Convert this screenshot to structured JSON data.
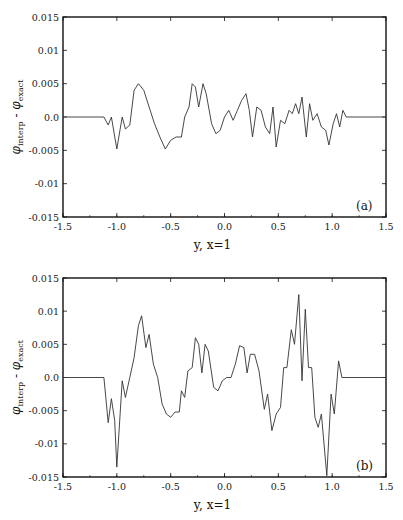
{
  "figure": {
    "panels": [
      {
        "tag": "(a)",
        "xlabel": "y, x=1",
        "ylabel_main": "φ",
        "ylabel_sub1": "interp",
        "ylabel_mid": " - ",
        "ylabel_sub2": "exact"
      },
      {
        "tag": "(b)",
        "xlabel": "y, x=1",
        "ylabel_main": "φ",
        "ylabel_sub1": "interp",
        "ylabel_mid": " - ",
        "ylabel_sub2": "exact"
      }
    ],
    "line_color": "#333333"
  },
  "chart_data": [
    {
      "type": "line",
      "title": "(a)",
      "xlabel": "y, x=1",
      "ylabel": "φ_interp - φ_exact",
      "xlim": [
        -1.5,
        1.5
      ],
      "ylim": [
        -0.015,
        0.015
      ],
      "xticks": [
        "-1.5",
        "-1.0",
        "-0.5",
        "0.0",
        "0.5",
        "1.0",
        "1.5"
      ],
      "yticks": [
        "0.015",
        "0.01",
        "0.005",
        "0.0",
        "-0.005",
        "-0.01",
        "-0.015"
      ],
      "grid": false,
      "legend": null,
      "x": [
        -1.5,
        -1.12,
        -1.08,
        -1.05,
        -1.0,
        -0.95,
        -0.92,
        -0.88,
        -0.84,
        -0.8,
        -0.75,
        -0.7,
        -0.65,
        -0.6,
        -0.55,
        -0.5,
        -0.45,
        -0.4,
        -0.37,
        -0.33,
        -0.3,
        -0.27,
        -0.24,
        -0.2,
        -0.17,
        -0.12,
        -0.08,
        -0.04,
        0.0,
        0.04,
        0.08,
        0.12,
        0.16,
        0.2,
        0.23,
        0.26,
        0.3,
        0.34,
        0.38,
        0.42,
        0.45,
        0.48,
        0.52,
        0.56,
        0.6,
        0.63,
        0.66,
        0.69,
        0.72,
        0.76,
        0.79,
        0.82,
        0.86,
        0.9,
        0.94,
        0.97,
        1.01,
        1.04,
        1.07,
        1.1,
        1.13,
        1.5
      ],
      "y": [
        0.0,
        0.0,
        -0.0012,
        0.0,
        -0.0048,
        0.0,
        -0.0018,
        -0.0012,
        0.004,
        0.005,
        0.004,
        0.0015,
        -0.001,
        -0.003,
        -0.0048,
        -0.0035,
        -0.003,
        -0.003,
        0.0,
        0.0015,
        0.005,
        0.0045,
        0.0015,
        0.005,
        0.0035,
        -0.001,
        -0.0025,
        -0.002,
        0.0,
        0.001,
        -0.0005,
        0.001,
        0.0025,
        0.0035,
        0.001,
        -0.003,
        0.0015,
        0.001,
        -0.0015,
        -0.0025,
        0.0015,
        -0.0045,
        -0.0005,
        -0.001,
        0.001,
        0.0005,
        0.002,
        0.0005,
        0.003,
        -0.003,
        0.002,
        -0.0005,
        0.0005,
        -0.0015,
        -0.002,
        -0.0042,
        -0.001,
        0.0005,
        -0.0015,
        0.001,
        0.0,
        0.0
      ]
    },
    {
      "type": "line",
      "title": "(b)",
      "xlabel": "y, x=1",
      "ylabel": "φ_interp - φ_exact",
      "xlim": [
        -1.5,
        1.5
      ],
      "ylim": [
        -0.015,
        0.015
      ],
      "xticks": [
        "-1.5",
        "-1.0",
        "-0.5",
        "0.0",
        "0.5",
        "1.0",
        "1.5"
      ],
      "yticks": [
        "0.015",
        "0.01",
        "0.005",
        "0.0",
        "-0.005",
        "-0.01",
        "-0.015"
      ],
      "grid": false,
      "legend": null,
      "x": [
        -1.5,
        -1.12,
        -1.08,
        -1.05,
        -1.02,
        -1.0,
        -0.95,
        -0.92,
        -0.88,
        -0.84,
        -0.8,
        -0.77,
        -0.73,
        -0.7,
        -0.66,
        -0.62,
        -0.58,
        -0.54,
        -0.5,
        -0.46,
        -0.42,
        -0.4,
        -0.37,
        -0.34,
        -0.3,
        -0.27,
        -0.24,
        -0.21,
        -0.18,
        -0.15,
        -0.1,
        -0.06,
        -0.02,
        0.02,
        0.06,
        0.1,
        0.14,
        0.18,
        0.21,
        0.24,
        0.28,
        0.32,
        0.37,
        0.4,
        0.44,
        0.48,
        0.52,
        0.55,
        0.58,
        0.62,
        0.65,
        0.69,
        0.72,
        0.75,
        0.78,
        0.81,
        0.84,
        0.87,
        0.9,
        0.95,
        0.99,
        1.02,
        1.06,
        1.09,
        1.5
      ],
      "y": [
        0.0,
        0.0,
        -0.0068,
        -0.0032,
        -0.0065,
        -0.0135,
        -0.0005,
        -0.003,
        0.0,
        0.003,
        0.0078,
        0.0093,
        0.0045,
        0.0065,
        0.002,
        0.0,
        -0.004,
        -0.0055,
        -0.006,
        -0.0052,
        -0.0052,
        -0.002,
        -0.003,
        0.001,
        0.0015,
        0.006,
        0.005,
        0.0007,
        0.005,
        0.004,
        -0.0015,
        -0.002,
        -0.0005,
        0.0,
        0.0,
        0.002,
        0.0048,
        0.0045,
        0.0007,
        0.0035,
        0.0035,
        0.001,
        -0.0048,
        -0.0025,
        -0.008,
        -0.0055,
        -0.0045,
        0.0015,
        0.0015,
        0.0072,
        0.005,
        0.0125,
        -0.0005,
        0.0103,
        0.0015,
        0.0015,
        -0.006,
        -0.0075,
        -0.0055,
        -0.0148,
        -0.0025,
        -0.0055,
        0.0025,
        0.0,
        0.0
      ]
    }
  ]
}
